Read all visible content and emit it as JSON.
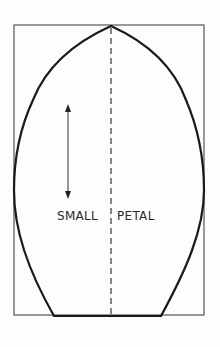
{
  "diagram": {
    "labels": {
      "left": "SMALL",
      "right": "PETAL"
    },
    "elements": {
      "bounding_box": "rectangle",
      "outline": "petal-shape",
      "center_line": "dashed-fold-line",
      "arrow": "double-headed-vertical-arrow"
    },
    "colors": {
      "outline": "#1a1a1a",
      "box": "#555555",
      "dash": "#444444",
      "background": "#fdfdfd"
    }
  }
}
